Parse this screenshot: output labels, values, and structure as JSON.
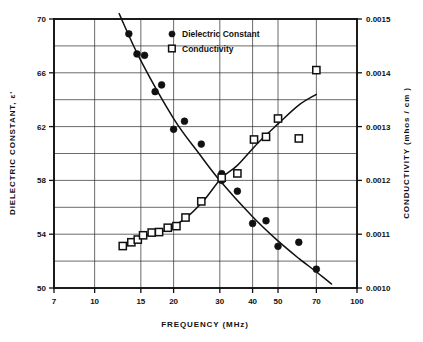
{
  "figure": {
    "kind": "scientific-line-scatter-plot",
    "background_color": "#ffffff",
    "ink_color": "#111111"
  },
  "axes": {
    "x": {
      "title": "FREQUENCY  (MHz)",
      "scale": "log",
      "min": 7,
      "max": 100,
      "tick_values": [
        7,
        10,
        15,
        20,
        30,
        40,
        50,
        70,
        100
      ],
      "tick_labels": [
        "7",
        "10",
        "15",
        "20",
        "30",
        "40",
        "50",
        "70",
        "100"
      ]
    },
    "y_left": {
      "title": "DIELECTRIC CONSTANT,  ε'",
      "scale": "linear",
      "min": 50,
      "max": 70,
      "tick_values": [
        50,
        54,
        58,
        62,
        66,
        70
      ],
      "tick_labels": [
        "50",
        "54",
        "58",
        "62",
        "66",
        "70"
      ],
      "minor_step": 2
    },
    "y_right": {
      "title": "CONDUCTIVITY   (mhos / cm )",
      "scale": "linear",
      "min": 0.001,
      "max": 0.0015,
      "tick_values": [
        0.001,
        0.0011,
        0.0012,
        0.0013,
        0.0014,
        0.0015
      ],
      "tick_labels": [
        "0.0010",
        "0.0011",
        "0.0012",
        "0.0013",
        "0.0014",
        "0.0015"
      ],
      "minor_step": 5e-05
    },
    "grid": "on"
  },
  "legend": {
    "position": "top-center-right",
    "entries": [
      {
        "marker": "filled-circle",
        "label": "Dielectric  Constant"
      },
      {
        "marker": "open-square",
        "label": "Conductivity"
      }
    ]
  },
  "chart_data": {
    "type": "scatter",
    "title": "",
    "subtitle": "",
    "xlabel": "FREQUENCY  (MHz)",
    "ylabel": "DIELECTRIC CONSTANT,  ε'",
    "ylabel_secondary": "CONDUCTIVITY   (mhos / cm )",
    "xscale": "log",
    "xlim": [
      7,
      100
    ],
    "ylim": [
      50,
      70
    ],
    "ylim_secondary": [
      0.001,
      0.0015
    ],
    "grid": true,
    "legend_position": "upper-center",
    "series": [
      {
        "name": "Dielectric Constant",
        "marker": "filled-circle",
        "axis": "left",
        "x": [
          13.5,
          14.5,
          15.5,
          17.0,
          18.0,
          20.0,
          22.0,
          25.5,
          30.5,
          30.5,
          35.0,
          40.0,
          45.0,
          50.0,
          60.0,
          70.0
        ],
        "y": [
          68.9,
          67.4,
          67.3,
          64.6,
          65.1,
          61.8,
          62.4,
          60.7,
          58.5,
          58.0,
          57.2,
          54.8,
          55.0,
          53.1,
          53.4,
          51.4
        ],
        "trend": {
          "x": [
            12.4,
            15.0,
            20.0,
            25.0,
            30.0,
            40.0,
            50.0,
            60.0,
            70.0,
            80.0
          ],
          "y": [
            70.4,
            66.9,
            62.6,
            60.0,
            58.0,
            55.3,
            53.5,
            52.2,
            51.2,
            50.3
          ]
        }
      },
      {
        "name": "Conductivity",
        "marker": "open-square",
        "axis": "right",
        "x": [
          12.8,
          13.8,
          14.6,
          15.3,
          16.5,
          17.6,
          19.0,
          20.5,
          22.2,
          25.5,
          30.5,
          35.0,
          40.5,
          45.0,
          50.0,
          60.0,
          70.0
        ],
        "y": [
          0.001078,
          0.001085,
          0.00109,
          0.001098,
          0.001103,
          0.001104,
          0.001112,
          0.001115,
          0.001131,
          0.001161,
          0.001205,
          0.001213,
          0.001276,
          0.001281,
          0.001315,
          0.001278,
          0.001405
        ],
        "trend": {
          "x": [
            12.6,
            15.0,
            18.0,
            22.0,
            26.0,
            30.5,
            35.0,
            42.0,
            50.0,
            60.0,
            70.0
          ],
          "y": [
            0.001073,
            0.001095,
            0.001104,
            0.001128,
            0.001162,
            0.001205,
            0.001228,
            0.00127,
            0.001305,
            0.00134,
            0.00136
          ]
        }
      }
    ]
  },
  "caption": {
    "text": ""
  }
}
